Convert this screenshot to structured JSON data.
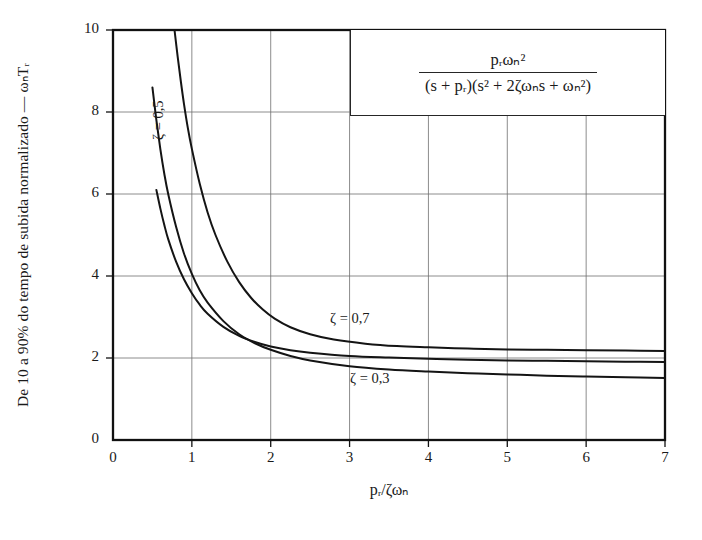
{
  "chart_data": {
    "type": "line",
    "title": "",
    "xlabel": "p_r/ζω_n",
    "ylabel": "De 10 a 90% do tempo de subida normalizado  —  ω_n T_r",
    "xlim": [
      0,
      7
    ],
    "ylim": [
      0,
      10
    ],
    "xticks": [
      0,
      1,
      2,
      3,
      4,
      5,
      6,
      7
    ],
    "yticks": [
      0,
      2,
      4,
      6,
      8,
      10
    ],
    "grid": true,
    "legend_position": "inline-curve-labels",
    "annotation_formula_numerator": "p_rω_n²",
    "annotation_formula_denominator": "(s + p_r)(s² + 2ζω_n s + ω_n²)",
    "series": [
      {
        "name": "ζ = 0,3",
        "label": "ζ = 0,3",
        "x": [
          0.5,
          0.55,
          0.6,
          0.65,
          0.7,
          0.8,
          0.9,
          1.0,
          1.1,
          1.2,
          1.4,
          1.6,
          1.8,
          2.0,
          2.25,
          2.5,
          3.0,
          3.5,
          4.0,
          4.5,
          5.0,
          5.5,
          6.0,
          6.5,
          7.0
        ],
        "y": [
          8.6,
          7.8,
          7.1,
          6.5,
          6.0,
          5.2,
          4.55,
          4.05,
          3.65,
          3.35,
          2.9,
          2.58,
          2.36,
          2.2,
          2.05,
          1.94,
          1.8,
          1.72,
          1.67,
          1.63,
          1.6,
          1.57,
          1.55,
          1.53,
          1.51
        ]
      },
      {
        "name": "ζ = 0,5",
        "label": "ζ = 0,5",
        "x": [
          0.55,
          0.6,
          0.65,
          0.7,
          0.8,
          0.9,
          1.0,
          1.1,
          1.2,
          1.4,
          1.6,
          1.8,
          2.0,
          2.25,
          2.5,
          3.0,
          3.5,
          4.0,
          4.5,
          5.0,
          5.5,
          6.0,
          6.5,
          7.0
        ],
        "y": [
          6.1,
          5.65,
          5.25,
          4.9,
          4.35,
          3.92,
          3.58,
          3.3,
          3.08,
          2.76,
          2.54,
          2.39,
          2.28,
          2.19,
          2.13,
          2.05,
          2.01,
          1.98,
          1.96,
          1.94,
          1.93,
          1.92,
          1.91,
          1.9
        ]
      },
      {
        "name": "ζ = 0,7",
        "label": "ζ = 0,7",
        "x": [
          0.78,
          0.82,
          0.86,
          0.9,
          0.95,
          1.0,
          1.1,
          1.2,
          1.3,
          1.45,
          1.6,
          1.75,
          1.9,
          2.05,
          2.25,
          2.5,
          2.8,
          3.2,
          3.6,
          4.0,
          4.5,
          5.0,
          5.5,
          6.0,
          6.5,
          7.0
        ],
        "y": [
          10.0,
          9.35,
          8.75,
          8.2,
          7.6,
          7.1,
          6.25,
          5.55,
          5.0,
          4.35,
          3.85,
          3.47,
          3.18,
          2.96,
          2.75,
          2.58,
          2.45,
          2.35,
          2.29,
          2.26,
          2.23,
          2.21,
          2.2,
          2.19,
          2.18,
          2.17
        ]
      }
    ]
  },
  "axes": {
    "x_tick_labels": [
      "0",
      "1",
      "2",
      "3",
      "4",
      "5",
      "6",
      "7"
    ],
    "y_tick_labels": [
      "0",
      "2",
      "4",
      "6",
      "8",
      "10"
    ],
    "x_axis_title": "pᵣ/ζωₙ",
    "y_axis_title": "De 10 a 90% do tempo de subida normalizado  —  ωₙTᵣ"
  },
  "formula": {
    "numerator": "pᵣωₙ²",
    "denominator": "(s + pᵣ)(s² + 2ζωₙs + ωₙ²)"
  },
  "curve_labels": {
    "zeta_07": "ζ = 0,7",
    "zeta_05": "ζ = 0,5",
    "zeta_03": "ζ = 0,3"
  },
  "colors": {
    "curve": "#141414",
    "axis": "#111111",
    "grid": "#6f6f6f",
    "background": "#ffffff"
  }
}
